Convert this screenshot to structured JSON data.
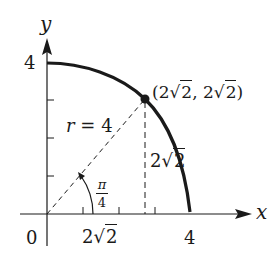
{
  "axes": {
    "x_label": "x",
    "y_label": "y",
    "origin_label": "0"
  },
  "ticks": {
    "x_four": "4",
    "y_four": "4",
    "x_two_root_two": {
      "coef": "2",
      "radicand": "2"
    }
  },
  "point": {
    "open": "(",
    "x": {
      "coef": "2",
      "radicand": "2"
    },
    "sep": ", ",
    "y": {
      "coef": "2",
      "radicand": "2"
    },
    "close": ")"
  },
  "vertical_segment_label": {
    "coef": "2",
    "radicand": "2"
  },
  "radius_label": {
    "var": "r",
    "eq": " = ",
    "value": "4"
  },
  "angle_label": {
    "numerator": "π",
    "denominator": "4"
  },
  "colors": {
    "ink": "#1a1a1a",
    "background": "#ffffff"
  }
}
